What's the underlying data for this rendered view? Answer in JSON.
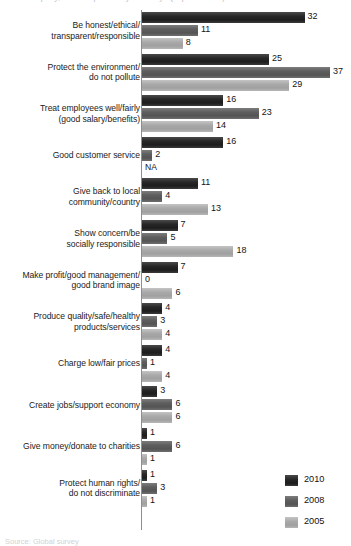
{
  "clipped_title": "…of company, what responsibility…society? (Top mentions)",
  "clipped_source": "Source: Global survey",
  "legend": {
    "position": "bottom-right",
    "entries": [
      {
        "label": "2010",
        "color": "#272727"
      },
      {
        "label": "2008",
        "color": "#5e5e5e"
      },
      {
        "label": "2005",
        "color": "#a9a9a9"
      }
    ]
  },
  "chart_data": {
    "type": "bar",
    "orientation": "horizontal",
    "title": "",
    "xlabel": "",
    "ylabel": "",
    "grid": false,
    "axis_line": true,
    "xlim": [
      0,
      40
    ],
    "categories": [
      "Be honest/ethical/\ntransparent/responsible",
      "Protect the environment/\ndo not pollute",
      "Treat employees well/fairly\n(good salary/benefits)",
      "Good customer service",
      "Give back to local\ncommunity/country",
      "Show concern/be\nsocially responsible",
      "Make profit/good management/\ngood brand image",
      "Produce quality/safe/healthy\nproducts/services",
      "Charge low/fair prices",
      "Create jobs/support economy",
      "Give money/donate to charities",
      "Protect human rights/\ndo not discriminate"
    ],
    "series": [
      {
        "name": "2010",
        "color": "#272727",
        "values": [
          32,
          25,
          16,
          16,
          11,
          7,
          7,
          4,
          4,
          3,
          1,
          1
        ],
        "labels": [
          "32",
          "25",
          "16",
          "16",
          "11",
          "7",
          "7",
          "4",
          "4",
          "3",
          "1",
          "1"
        ]
      },
      {
        "name": "2008",
        "color": "#5e5e5e",
        "values": [
          11,
          37,
          23,
          2,
          4,
          5,
          0,
          3,
          1,
          6,
          6,
          3
        ],
        "labels": [
          "11",
          "37",
          "23",
          "2",
          "4",
          "5",
          "0",
          "3",
          "1",
          "6",
          "6",
          "3"
        ]
      },
      {
        "name": "2005",
        "color": "#a9a9a9",
        "values": [
          8,
          29,
          14,
          null,
          13,
          18,
          6,
          4,
          4,
          6,
          1,
          1
        ],
        "labels": [
          "8",
          "29",
          "14",
          "NA",
          "13",
          "18",
          "6",
          "4",
          "4",
          "6",
          "1",
          "1"
        ]
      }
    ]
  }
}
